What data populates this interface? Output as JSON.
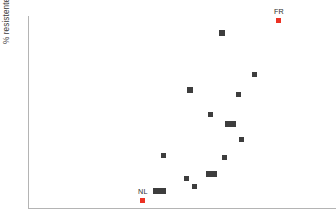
{
  "figure": {
    "background_color": "#ffffff",
    "width": 336,
    "height": 223
  },
  "axes": {
    "y_title_prefix": "% resistente ",
    "y_title_species": "S. pneumoniae",
    "y_title_full": "% resistente S. pneumoniae",
    "x_title": "",
    "axis_color": "#b4b4b4",
    "x_tick_labels": [],
    "y_tick_labels": []
  },
  "annotations": {
    "highlight_color": "#ec3224",
    "marker_color": "#3d3d3d",
    "labels": [
      {
        "text": "FR",
        "country": "France"
      },
      {
        "text": "NL",
        "country": "Netherlands"
      }
    ]
  },
  "chart_data": {
    "type": "scatter",
    "title": "",
    "xlabel": "",
    "ylabel": "% resistente S. pneumoniae",
    "grid": false,
    "legend": false,
    "xlim": [
      0,
      100
    ],
    "ylim": [
      0,
      100
    ],
    "note": "Positions are given in figure pixel coordinates (px_x, px_y) of the marker centre; plot box spans x 28-336 px and y 16-209 px.",
    "series": [
      {
        "name": "countries",
        "color": "#3d3d3d",
        "points": [
          {
            "label": "",
            "px_x": 222,
            "px_y": 33,
            "w": 6,
            "h": 6
          },
          {
            "label": "",
            "px_x": 254,
            "px_y": 74,
            "w": 5,
            "h": 5
          },
          {
            "label": "",
            "px_x": 190,
            "px_y": 90,
            "w": 6,
            "h": 6
          },
          {
            "label": "",
            "px_x": 238,
            "px_y": 94,
            "w": 5,
            "h": 5
          },
          {
            "label": "",
            "px_x": 210,
            "px_y": 114,
            "w": 5,
            "h": 5
          },
          {
            "label": "",
            "px_x": 230,
            "px_y": 124,
            "w": 11,
            "h": 6
          },
          {
            "label": "",
            "px_x": 241,
            "px_y": 139,
            "w": 5,
            "h": 5
          },
          {
            "label": "",
            "px_x": 163,
            "px_y": 155,
            "w": 5,
            "h": 5
          },
          {
            "label": "",
            "px_x": 224,
            "px_y": 157,
            "w": 5,
            "h": 5
          },
          {
            "label": "",
            "px_x": 211,
            "px_y": 174,
            "w": 11,
            "h": 6
          },
          {
            "label": "",
            "px_x": 186,
            "px_y": 178,
            "w": 5,
            "h": 5
          },
          {
            "label": "",
            "px_x": 194,
            "px_y": 186,
            "w": 5,
            "h": 5
          },
          {
            "label": "",
            "px_x": 159,
            "px_y": 191,
            "w": 13,
            "h": 6
          }
        ]
      },
      {
        "name": "highlighted-countries",
        "color": "#ec3224",
        "points": [
          {
            "label": "FR",
            "px_x": 278,
            "px_y": 20,
            "w": 5,
            "h": 5,
            "label_dx": -4,
            "label_dy": -12
          },
          {
            "label": "NL",
            "px_x": 142,
            "px_y": 200,
            "w": 5,
            "h": 5,
            "label_dx": -4,
            "label_dy": -12
          }
        ]
      }
    ]
  }
}
